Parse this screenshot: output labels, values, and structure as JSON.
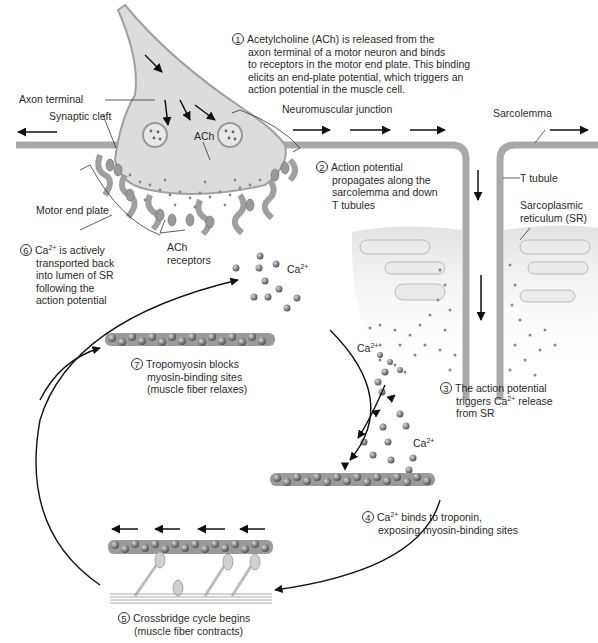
{
  "labels": {
    "axon_terminal": "Axon terminal",
    "synaptic_cleft": "Synaptic cleft",
    "ach": "ACh",
    "motor_end_plate": "Motor end plate",
    "ach_receptors_1": "ACh",
    "ach_receptors_2": "receptors",
    "neuromuscular_junction": "Neuromuscular junction",
    "sarcolemma": "Sarcolemma",
    "t_tubule": "T tubule",
    "sr_1": "Sarcoplasmic",
    "sr_2": "reticulum (SR)",
    "ca_top_base": "Ca",
    "ca_top_sup": "2+",
    "ca_left_base": "Ca",
    "ca_left_sup": "2+",
    "ca_right_base": "Ca",
    "ca_right_sup": "2+"
  },
  "steps": [
    {
      "num": "1",
      "lines": [
        "Acetylcholine (ACh) is released from the",
        "axon terminal of a motor neuron and binds",
        "to receptors in the motor end plate. This binding",
        "elicits an end-plate potential, which triggers an",
        "action potential in the muscle cell."
      ]
    },
    {
      "num": "2",
      "lines": [
        "Action potential",
        "propagates along the",
        "sarcolemma and down",
        "T tubules"
      ]
    },
    {
      "num": "3",
      "line1_pre": "The action potential",
      "line2_pre": "triggers Ca",
      "line2_sup": "2+",
      "line2_post": " release",
      "line3": "from SR"
    },
    {
      "num": "4",
      "line1_pre": "Ca",
      "line1_sup": "2+",
      "line1_post": " binds to troponin,",
      "line2": "exposing myosin-binding sites"
    },
    {
      "num": "5",
      "lines": [
        "Crossbridge cycle begins",
        "(muscle fiber contracts)"
      ]
    },
    {
      "num": "6",
      "line1_pre": "Ca",
      "line1_sup": "2+",
      "line1_post": " is actively",
      "lines_rest": [
        "transported back",
        "into lumen of SR",
        "following the",
        "action potential"
      ]
    },
    {
      "num": "7",
      "lines": [
        "Tropomyosin blocks",
        "myosin-binding sites",
        "(muscle fiber relaxes)"
      ]
    }
  ],
  "colors": {
    "membrane": "#a9a9a9",
    "cytoplasm": "#dcdcdc",
    "sr": "#e6e6e6",
    "dot": "#777777",
    "text": "#2a2a2a"
  }
}
